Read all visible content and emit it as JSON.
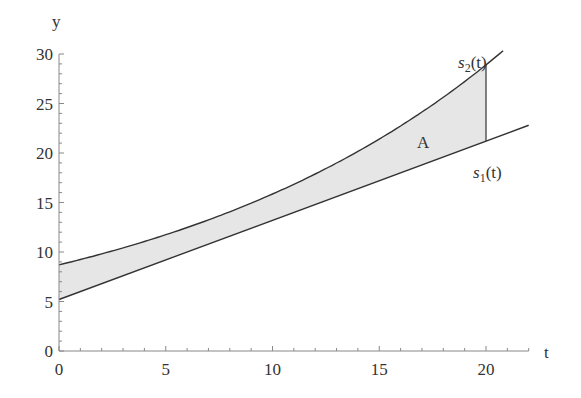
{
  "chart_data": {
    "type": "area",
    "title": "",
    "xlabel": "t",
    "ylabel": "y",
    "xlim": [
      0,
      22
    ],
    "ylim": [
      0,
      30
    ],
    "x_ticks": [
      0,
      5,
      10,
      15,
      20
    ],
    "y_ticks": [
      0,
      5,
      10,
      15,
      20,
      25,
      30
    ],
    "grid": false,
    "series": [
      {
        "name": "s1(t)",
        "label_main": "s",
        "label_sub": "1",
        "label_tail": "(t)",
        "form": "linear",
        "x": [
          0,
          5,
          10,
          15,
          20,
          22
        ],
        "values": [
          5.2,
          9.2,
          13.2,
          17.2,
          21.2,
          22.8
        ]
      },
      {
        "name": "s2(t)",
        "label_main": "s",
        "label_sub": "2",
        "label_tail": "(t)",
        "form": "exponential",
        "x": [
          0,
          5,
          10,
          15,
          20,
          20.9
        ],
        "values": [
          8.7,
          11.7,
          15.9,
          21.5,
          28.9,
          30.5
        ]
      }
    ],
    "shaded_region": {
      "label": "A",
      "between": [
        "s1(t)",
        "s2(t)"
      ],
      "t_range": [
        0,
        20
      ],
      "color": "#e6e6e6"
    },
    "annotations": [
      {
        "text": "A",
        "x": 17.1,
        "y": 21.0
      },
      {
        "text": "s2(t)",
        "x": 19.4,
        "y": 28.7
      },
      {
        "text": "s1(t)",
        "x": 20.2,
        "y": 17.8
      }
    ]
  },
  "axis": {
    "x_label": "t",
    "y_label": "y"
  },
  "labels": {
    "area": "A",
    "s2_main": "s",
    "s2_sub": "2",
    "s2_tail": "(t)",
    "s1_main": "s",
    "s1_sub": "1",
    "s1_tail": "(t)"
  }
}
